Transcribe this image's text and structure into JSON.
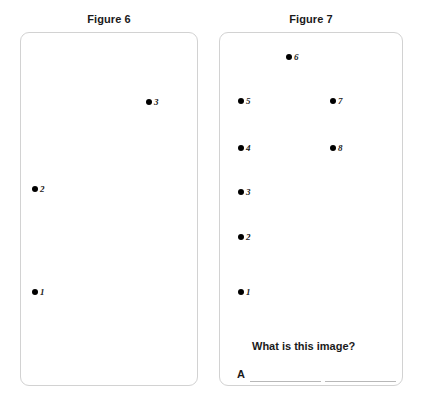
{
  "page": {
    "background": "#ffffff",
    "dot_color": "#000000",
    "panel_border_color": "#d2d2d2",
    "rule_color": "#b8b8b8"
  },
  "figures": [
    {
      "id": "figure-6",
      "title": "Figure 6",
      "points": [
        {
          "label": "3",
          "x": 149,
          "y": 102
        },
        {
          "label": "2",
          "x": 35,
          "y": 189
        },
        {
          "label": "1",
          "x": 35,
          "y": 292
        }
      ]
    },
    {
      "id": "figure-7",
      "title": "Figure 7",
      "points": [
        {
          "label": "6",
          "x": 289,
          "y": 57
        },
        {
          "label": "5",
          "x": 241,
          "y": 101
        },
        {
          "label": "7",
          "x": 333,
          "y": 101
        },
        {
          "label": "4",
          "x": 241,
          "y": 148
        },
        {
          "label": "8",
          "x": 333,
          "y": 148
        },
        {
          "label": "3",
          "x": 241,
          "y": 192
        },
        {
          "label": "2",
          "x": 241,
          "y": 237
        },
        {
          "label": "1",
          "x": 241,
          "y": 292
        }
      ]
    }
  ],
  "question": {
    "prompt": "What is this image?",
    "answer_prefix": "A",
    "answer_value": ""
  }
}
